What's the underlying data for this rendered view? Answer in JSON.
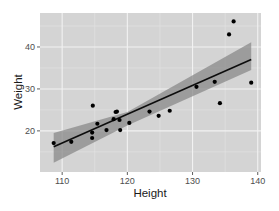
{
  "chart_data": {
    "type": "scatter",
    "title": "",
    "xlabel": "Height",
    "ylabel": "Weight",
    "xlim": [
      106.6,
      140.5
    ],
    "ylim": [
      10.2,
      48.1
    ],
    "x_ticks": [
      110,
      120,
      130,
      140
    ],
    "y_ticks": [
      20,
      30,
      40
    ],
    "x_tick_labels": [
      "110",
      "120",
      "130",
      "140"
    ],
    "y_tick_labels": [
      "20",
      "30",
      "40"
    ],
    "grid": true,
    "legend": null,
    "points": [
      {
        "x": 108.7,
        "y": 17.1
      },
      {
        "x": 111.4,
        "y": 17.4
      },
      {
        "x": 114.6,
        "y": 18.3
      },
      {
        "x": 114.6,
        "y": 19.6
      },
      {
        "x": 114.7,
        "y": 26.0
      },
      {
        "x": 115.4,
        "y": 21.7
      },
      {
        "x": 116.8,
        "y": 20.2
      },
      {
        "x": 117.9,
        "y": 22.8
      },
      {
        "x": 118.2,
        "y": 24.5
      },
      {
        "x": 118.4,
        "y": 24.6
      },
      {
        "x": 118.8,
        "y": 22.6
      },
      {
        "x": 118.9,
        "y": 20.2
      },
      {
        "x": 120.3,
        "y": 21.9
      },
      {
        "x": 123.4,
        "y": 24.6
      },
      {
        "x": 124.8,
        "y": 23.6
      },
      {
        "x": 126.5,
        "y": 24.8
      },
      {
        "x": 130.6,
        "y": 30.5
      },
      {
        "x": 133.4,
        "y": 31.7
      },
      {
        "x": 134.2,
        "y": 26.6
      },
      {
        "x": 135.6,
        "y": 43.0
      },
      {
        "x": 136.3,
        "y": 46.1
      },
      {
        "x": 139.0,
        "y": 31.5
      }
    ],
    "regression_line": {
      "method": "lm",
      "x": [
        108.7,
        139.0
      ],
      "y": [
        16.2,
        37.0
      ]
    },
    "confidence_band": {
      "x": [
        108.7,
        120.0,
        139.0
      ],
      "upper": [
        19.5,
        24.5,
        41.1
      ],
      "lower": [
        12.4,
        21.3,
        34.5
      ]
    }
  },
  "style": {
    "panel_bg": "#d4d4d4",
    "grid_major": "#f2f2f2",
    "grid_minor": "#e4e4e4",
    "band_fill": "#8a8a8a",
    "line_color": "#0d0d0d",
    "point_color": "#000000"
  }
}
